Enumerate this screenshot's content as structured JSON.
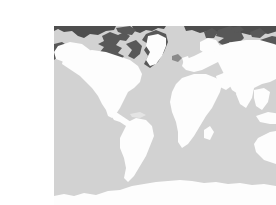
{
  "page": {
    "background_color": "#ffffff",
    "width": 276,
    "height": 205
  },
  "figure": {
    "title": "World Map",
    "caption": "",
    "type": "world-map-thumbnail",
    "projection": "equirectangular",
    "bounds": {
      "left": 14,
      "top": 10,
      "width": 249,
      "height": 180
    },
    "colors": {
      "ocean": "#d2d2d2",
      "land": "#fdfdfd",
      "polar_islands": "#585858",
      "arctic_rim": "#4e4e4e",
      "coast_shadow": "#b9b9b9"
    },
    "legend": {
      "visible": false,
      "entries": [
        {
          "label": "Land",
          "color": "#fdfdfd"
        },
        {
          "label": "Ocean",
          "color": "#d2d2d2"
        },
        {
          "label": "Arctic islands",
          "color": "#585858"
        }
      ]
    },
    "graticule": {
      "visible": false
    },
    "labels": {
      "visible": false
    },
    "regions": [
      {
        "name": "North America",
        "fill": "land"
      },
      {
        "name": "Greenland",
        "fill": "land"
      },
      {
        "name": "Canadian Arctic Archipelago",
        "fill": "polar_islands"
      },
      {
        "name": "South America",
        "fill": "land"
      },
      {
        "name": "Europe",
        "fill": "land"
      },
      {
        "name": "Scandinavia",
        "fill": "land"
      },
      {
        "name": "Svalbard",
        "fill": "polar_islands"
      },
      {
        "name": "Novaya Zemlya",
        "fill": "polar_islands"
      },
      {
        "name": "Africa",
        "fill": "land"
      },
      {
        "name": "Madagascar",
        "fill": "land"
      },
      {
        "name": "Asia",
        "fill": "land"
      },
      {
        "name": "Severnaya Zemlya",
        "fill": "polar_islands"
      },
      {
        "name": "New Siberian Islands",
        "fill": "polar_islands"
      },
      {
        "name": "Japan",
        "fill": "land"
      },
      {
        "name": "Indonesia",
        "fill": "land"
      },
      {
        "name": "New Guinea",
        "fill": "land"
      },
      {
        "name": "Australia",
        "fill": "land"
      },
      {
        "name": "New Zealand",
        "fill": "land"
      },
      {
        "name": "Antarctica",
        "fill": "land"
      }
    ]
  }
}
